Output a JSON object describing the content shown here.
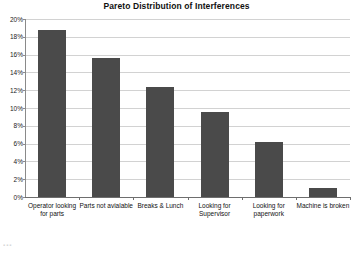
{
  "chart_data": {
    "type": "bar",
    "title": "Pareto Distribution of Interferences",
    "xlabel": "",
    "ylabel": "",
    "categories": [
      "Operator looking for parts",
      "Parts not avialable",
      "Breaks & Lunch",
      "Looking for Supervisor",
      "Looking for paperwork",
      "Machine is broken"
    ],
    "values": [
      18.8,
      15.6,
      12.4,
      9.6,
      6.2,
      1.0
    ],
    "ylim": [
      0,
      20
    ],
    "ytick_labels": [
      "20%",
      "18%",
      "16%",
      "14%",
      "12%",
      "10%",
      "8%",
      "6%",
      "4%",
      "2%",
      "0%"
    ],
    "ytick_values": [
      20,
      18,
      16,
      14,
      12,
      10,
      8,
      6,
      4,
      2,
      0
    ],
    "grid": true,
    "legend": false,
    "bar_color": "#4a4a4a",
    "grid_color": "#d2d2d2",
    "axis_color": "#6e6e6e",
    "background": "#ffffff"
  },
  "artifact": {
    "mark": "▪▪▪"
  }
}
